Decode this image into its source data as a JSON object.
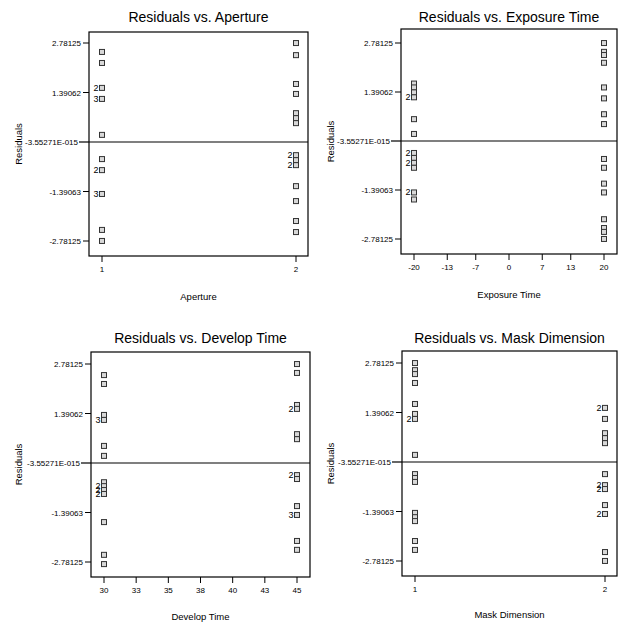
{
  "chart_data": [
    {
      "type": "scatter",
      "title": "Residuals vs. Aperture",
      "xlabel": "Aperture",
      "ylabel": "Residuals",
      "xticks": [
        "1",
        "2"
      ],
      "xtick_values": [
        1,
        2
      ],
      "xlim": [
        1,
        2
      ],
      "yticks": [
        "2.78125",
        "1.39062",
        "-3.55271E-015",
        "-1.39063",
        "-2.78125"
      ],
      "ytick_values": [
        2.78125,
        1.39062,
        0,
        -1.39063,
        -2.78125
      ],
      "ylim": [
        -3.07,
        3.17
      ],
      "reference_line": 0,
      "points": [
        {
          "x": 1,
          "y": 2.53,
          "n": 1
        },
        {
          "x": 1,
          "y": 2.22,
          "n": 1
        },
        {
          "x": 1,
          "y": 1.52,
          "n": 2
        },
        {
          "x": 1,
          "y": 1.21,
          "n": 3
        },
        {
          "x": 1,
          "y": 0.2,
          "n": 1
        },
        {
          "x": 1,
          "y": -0.48,
          "n": 1
        },
        {
          "x": 1,
          "y": -0.79,
          "n": 2
        },
        {
          "x": 1,
          "y": -1.46,
          "n": 3
        },
        {
          "x": 1,
          "y": -2.47,
          "n": 1
        },
        {
          "x": 1,
          "y": -2.78,
          "n": 1
        },
        {
          "x": 2,
          "y": 2.78,
          "n": 1
        },
        {
          "x": 2,
          "y": 2.44,
          "n": 1
        },
        {
          "x": 2,
          "y": 1.63,
          "n": 1
        },
        {
          "x": 2,
          "y": 1.35,
          "n": 1
        },
        {
          "x": 2,
          "y": 0.81,
          "n": 1
        },
        {
          "x": 2,
          "y": 0.67,
          "n": 1
        },
        {
          "x": 2,
          "y": 0.53,
          "n": 1
        },
        {
          "x": 2,
          "y": -0.37,
          "n": 2
        },
        {
          "x": 2,
          "y": -0.51,
          "n": 1
        },
        {
          "x": 2,
          "y": -0.65,
          "n": 2
        },
        {
          "x": 2,
          "y": -1.24,
          "n": 1
        },
        {
          "x": 2,
          "y": -1.66,
          "n": 1
        },
        {
          "x": 2,
          "y": -2.22,
          "n": 1
        },
        {
          "x": 2,
          "y": -2.53,
          "n": 1
        }
      ]
    },
    {
      "type": "scatter",
      "title": "Residuals vs. Exposure Time",
      "xlabel": "Exposure Time",
      "ylabel": "Residuals",
      "xticks": [
        "-20",
        "-13",
        "-7",
        "0",
        "7",
        "13",
        "20"
      ],
      "xtick_values": [
        -20,
        -13,
        -7,
        0,
        7,
        13,
        20
      ],
      "xlim": [
        -20,
        20
      ],
      "yticks": [
        "2.78125",
        "1.39062",
        "-3.55271E-015",
        "-1.39063",
        "-2.78125"
      ],
      "ytick_values": [
        2.78125,
        1.39062,
        0,
        -1.39063,
        -2.78125
      ],
      "ylim": [
        -3.07,
        3.17
      ],
      "reference_line": 0,
      "points": [
        {
          "x": -20,
          "y": 1.63,
          "n": 1
        },
        {
          "x": -20,
          "y": 1.52,
          "n": 1
        },
        {
          "x": -20,
          "y": 1.38,
          "n": 1
        },
        {
          "x": -20,
          "y": 1.24,
          "n": 2
        },
        {
          "x": -20,
          "y": 0.62,
          "n": 1
        },
        {
          "x": -20,
          "y": 0.2,
          "n": 1
        },
        {
          "x": -20,
          "y": -0.34,
          "n": 2
        },
        {
          "x": -20,
          "y": -0.48,
          "n": 1
        },
        {
          "x": -20,
          "y": -0.62,
          "n": 2
        },
        {
          "x": -20,
          "y": -0.76,
          "n": 1
        },
        {
          "x": -20,
          "y": -1.46,
          "n": 2
        },
        {
          "x": -20,
          "y": -1.66,
          "n": 1
        },
        {
          "x": 20,
          "y": 2.78,
          "n": 1
        },
        {
          "x": 20,
          "y": 2.53,
          "n": 1
        },
        {
          "x": 20,
          "y": 2.44,
          "n": 1
        },
        {
          "x": 20,
          "y": 2.22,
          "n": 1
        },
        {
          "x": 20,
          "y": 1.52,
          "n": 1
        },
        {
          "x": 20,
          "y": 1.21,
          "n": 1
        },
        {
          "x": 20,
          "y": 0.76,
          "n": 1
        },
        {
          "x": 20,
          "y": 0.48,
          "n": 1
        },
        {
          "x": 20,
          "y": -0.51,
          "n": 1
        },
        {
          "x": 20,
          "y": -0.76,
          "n": 1
        },
        {
          "x": 20,
          "y": -1.21,
          "n": 1
        },
        {
          "x": 20,
          "y": -1.46,
          "n": 1
        },
        {
          "x": 20,
          "y": -2.22,
          "n": 1
        },
        {
          "x": 20,
          "y": -2.47,
          "n": 1
        },
        {
          "x": 20,
          "y": -2.58,
          "n": 1
        },
        {
          "x": 20,
          "y": -2.78,
          "n": 1
        }
      ]
    },
    {
      "type": "scatter",
      "title": "Residuals vs. Develop Time",
      "xlabel": "Develop Time",
      "ylabel": "Residuals",
      "xticks": [
        "30",
        "33",
        "35",
        "38",
        "40",
        "43",
        "45"
      ],
      "xtick_values": [
        30,
        32.5,
        35,
        37.5,
        40,
        42.5,
        45
      ],
      "xlim": [
        30,
        45
      ],
      "yticks": [
        "2.78125",
        "1.39062",
        "-3.55271E-015",
        "-1.39063",
        "-2.78125"
      ],
      "ytick_values": [
        2.78125,
        1.39062,
        0,
        -1.39063,
        -2.78125
      ],
      "ylim": [
        -3.07,
        3.17
      ],
      "reference_line": 0,
      "points": [
        {
          "x": 30,
          "y": 2.47,
          "n": 1
        },
        {
          "x": 30,
          "y": 2.22,
          "n": 1
        },
        {
          "x": 30,
          "y": 1.35,
          "n": 1
        },
        {
          "x": 30,
          "y": 1.21,
          "n": 3
        },
        {
          "x": 30,
          "y": 0.48,
          "n": 1
        },
        {
          "x": 30,
          "y": 0.2,
          "n": 1
        },
        {
          "x": 30,
          "y": -0.54,
          "n": 1
        },
        {
          "x": 30,
          "y": -0.65,
          "n": 2
        },
        {
          "x": 30,
          "y": -0.76,
          "n": 2
        },
        {
          "x": 30,
          "y": -0.87,
          "n": 2
        },
        {
          "x": 30,
          "y": -1.66,
          "n": 1
        },
        {
          "x": 30,
          "y": -2.58,
          "n": 1
        },
        {
          "x": 30,
          "y": -2.84,
          "n": 1
        },
        {
          "x": 45,
          "y": 2.78,
          "n": 1
        },
        {
          "x": 45,
          "y": 2.53,
          "n": 1
        },
        {
          "x": 45,
          "y": 1.63,
          "n": 1
        },
        {
          "x": 45,
          "y": 1.52,
          "n": 2
        },
        {
          "x": 45,
          "y": 0.81,
          "n": 1
        },
        {
          "x": 45,
          "y": 0.67,
          "n": 1
        },
        {
          "x": 45,
          "y": -0.34,
          "n": 2
        },
        {
          "x": 45,
          "y": -0.45,
          "n": 1
        },
        {
          "x": 45,
          "y": -1.21,
          "n": 1
        },
        {
          "x": 45,
          "y": -1.46,
          "n": 3
        },
        {
          "x": 45,
          "y": -2.19,
          "n": 1
        },
        {
          "x": 45,
          "y": -2.44,
          "n": 1
        }
      ]
    },
    {
      "type": "scatter",
      "title": "Residuals vs. Mask Dimension",
      "xlabel": "Mask Dimension",
      "ylabel": "Residuals",
      "xticks": [
        "1",
        "2"
      ],
      "xtick_values": [
        1,
        2
      ],
      "xlim": [
        1,
        2
      ],
      "yticks": [
        "2.78125",
        "1.39062",
        "-3.55271E-015",
        "-1.39063",
        "-2.78125"
      ],
      "ytick_values": [
        2.78125,
        1.39062,
        0,
        -1.39063,
        -2.78125
      ],
      "ylim": [
        -3.07,
        3.17
      ],
      "reference_line": 0,
      "points": [
        {
          "x": 1,
          "y": 2.78,
          "n": 1
        },
        {
          "x": 1,
          "y": 2.58,
          "n": 1
        },
        {
          "x": 1,
          "y": 2.47,
          "n": 1
        },
        {
          "x": 1,
          "y": 2.22,
          "n": 1
        },
        {
          "x": 1,
          "y": 1.63,
          "n": 1
        },
        {
          "x": 1,
          "y": 1.35,
          "n": 1
        },
        {
          "x": 1,
          "y": 1.21,
          "n": 2
        },
        {
          "x": 1,
          "y": 0.2,
          "n": 1
        },
        {
          "x": 1,
          "y": -0.34,
          "n": 1
        },
        {
          "x": 1,
          "y": -0.45,
          "n": 1
        },
        {
          "x": 1,
          "y": -0.56,
          "n": 1
        },
        {
          "x": 1,
          "y": -1.43,
          "n": 1
        },
        {
          "x": 1,
          "y": -1.55,
          "n": 1
        },
        {
          "x": 1,
          "y": -1.66,
          "n": 1
        },
        {
          "x": 1,
          "y": -2.22,
          "n": 1
        },
        {
          "x": 1,
          "y": -2.47,
          "n": 1
        },
        {
          "x": 2,
          "y": 1.52,
          "n": 2
        },
        {
          "x": 2,
          "y": 1.21,
          "n": 1
        },
        {
          "x": 2,
          "y": 0.81,
          "n": 1
        },
        {
          "x": 2,
          "y": 0.67,
          "n": 1
        },
        {
          "x": 2,
          "y": 0.53,
          "n": 1
        },
        {
          "x": 2,
          "y": -0.34,
          "n": 1
        },
        {
          "x": 2,
          "y": -0.65,
          "n": 2
        },
        {
          "x": 2,
          "y": -0.76,
          "n": 2
        },
        {
          "x": 2,
          "y": -1.21,
          "n": 1
        },
        {
          "x": 2,
          "y": -1.46,
          "n": 2
        },
        {
          "x": 2,
          "y": -2.53,
          "n": 1
        },
        {
          "x": 2,
          "y": -2.78,
          "n": 1
        }
      ]
    }
  ],
  "layout": {
    "charts": [
      {
        "left": 89,
        "top": 32,
        "right": 308,
        "bottom": 256,
        "zero_y": 142,
        "tick_top_y": 43,
        "x_first": 102,
        "x_last": 296,
        "title_y": 22,
        "xlabel_y": 300,
        "ylabel_x": 22
      },
      {
        "left": 401,
        "top": 29,
        "right": 617,
        "bottom": 254,
        "zero_y": 141,
        "tick_top_y": 43,
        "x_first": 414,
        "x_last": 604,
        "title_y": 22,
        "xlabel_y": 298,
        "ylabel_x": 334
      },
      {
        "left": 91,
        "top": 352,
        "right": 310,
        "bottom": 577,
        "zero_y": 463,
        "tick_top_y": 364,
        "x_first": 104,
        "x_last": 297,
        "title_y": 343,
        "xlabel_y": 620,
        "ylabel_x": 22
      },
      {
        "left": 402,
        "top": 351,
        "right": 617,
        "bottom": 576,
        "zero_y": 462,
        "tick_top_y": 363,
        "x_first": 415,
        "x_last": 605,
        "title_y": 343,
        "xlabel_y": 618,
        "ylabel_x": 334
      }
    ]
  }
}
